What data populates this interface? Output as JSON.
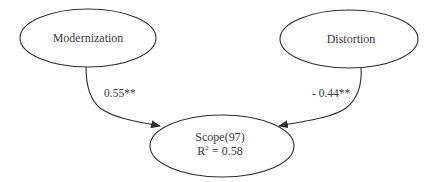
{
  "diagram": {
    "type": "path-diagram",
    "colors": {
      "stroke": "#2e2e2e",
      "text": "#3a3a3a",
      "background": "#ffffff"
    },
    "nodes": [
      {
        "id": "modernization",
        "label": "Modernization"
      },
      {
        "id": "distortion",
        "label": "Distortion"
      },
      {
        "id": "scope",
        "label": "Scope(97)",
        "r2_prefix": "R",
        "r2_sup": "2",
        "r2_value": " = 0.58"
      }
    ],
    "edges": [
      {
        "from": "modernization",
        "to": "scope",
        "label": "0.55**"
      },
      {
        "from": "distortion",
        "to": "scope",
        "label": "- 0.44**"
      }
    ]
  }
}
